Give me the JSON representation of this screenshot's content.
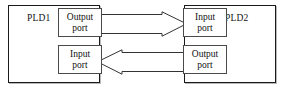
{
  "diagram": {
    "canvas": {
      "width": 284,
      "height": 92,
      "background": "#ffffff"
    },
    "stroke_color": "#1a1a1a",
    "port_stroke_color": "#4a4a4a",
    "arrow_fill": "#ffffff",
    "arrow_stroke": "#333333",
    "devices": [
      {
        "id": "pld1",
        "label": "PLD1",
        "ports": [
          {
            "id": "pld1-output",
            "line1": "Output",
            "line2": "port",
            "direction": "output"
          },
          {
            "id": "pld1-input",
            "line1": "Input",
            "line2": "port",
            "direction": "input"
          }
        ]
      },
      {
        "id": "pld2",
        "label": "PLD2",
        "ports": [
          {
            "id": "pld2-input",
            "line1": "Input",
            "line2": "port",
            "direction": "input"
          },
          {
            "id": "pld2-output",
            "line1": "Output",
            "line2": "port",
            "direction": "output"
          }
        ]
      }
    ],
    "connections": [
      {
        "id": "out-to-in",
        "from": "pld1-output",
        "to": "pld2-input",
        "points": "right",
        "style": "hollow-block-arrow"
      },
      {
        "id": "in-from-out",
        "from": "pld2-output",
        "to": "pld1-input",
        "points": "left",
        "style": "hollow-block-arrow"
      }
    ]
  }
}
